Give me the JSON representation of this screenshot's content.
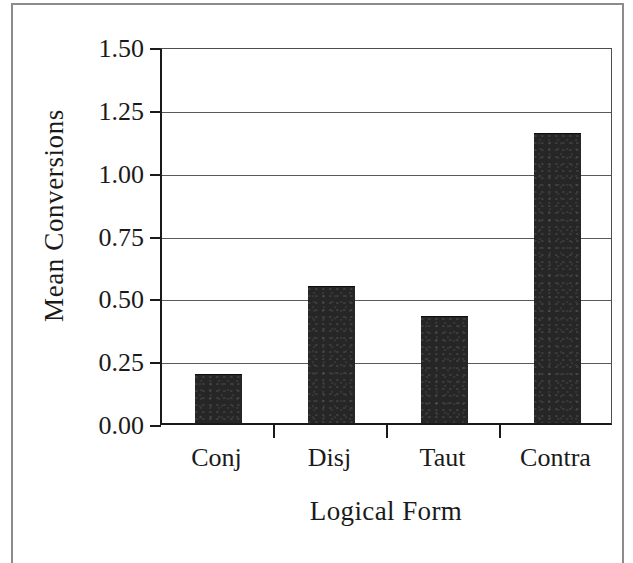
{
  "chart_data": {
    "type": "bar",
    "title": "",
    "xlabel": "Logical Form",
    "ylabel": "Mean Conversions",
    "categories": [
      "Conj",
      "Disj",
      "Taut",
      "Contra"
    ],
    "values": [
      0.19,
      0.54,
      0.42,
      1.15
    ],
    "ylim": [
      0.0,
      1.5
    ],
    "ytick_labels": [
      "0.00",
      "0.25",
      "0.50",
      "0.75",
      "1.00",
      "1.25",
      "1.50"
    ],
    "ytick_values": [
      0.0,
      0.25,
      0.5,
      0.75,
      1.0,
      1.25,
      1.5
    ],
    "grid": true,
    "legend": false,
    "bar_color": "#262626",
    "axis_color": "#1a1a1a",
    "grid_color": "#5a5a5a",
    "background": "#ffffff"
  }
}
